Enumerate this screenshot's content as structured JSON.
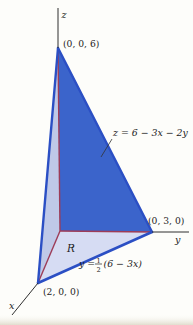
{
  "figure": {
    "colors": {
      "background": "#fdfdfa",
      "plane_fill": "#3b64cb",
      "side_wall_fill": "#bfc9e8",
      "region_fill": "#d6dcf3",
      "edge_blue": "#2b4fc4",
      "hidden_axis_red": "#9d3c58",
      "axis_black": "#2f2f2f",
      "text": "#1c1c1c",
      "page_edge_tint": "#e8e4d6"
    },
    "labels": {
      "z_axis": "z",
      "y_axis": "y",
      "x_axis": "x",
      "apex_point": "(0, 0, 6)",
      "y_intercept_point": "(0, 3, 0)",
      "x_intercept_point": "(2, 0, 0)",
      "plane_equation": "z = 6 − 3x − 2y",
      "region": "R",
      "boundary_prefix": "y =",
      "fraction_numerator": "1",
      "fraction_denominator": "2",
      "boundary_suffix": "(6 − 3x)"
    }
  }
}
